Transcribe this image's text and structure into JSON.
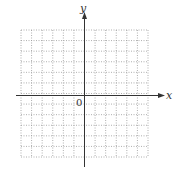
{
  "diagram": {
    "type": "coordinate-grid",
    "x_axis_label": "x",
    "y_axis_label": "y",
    "origin_label": "0",
    "grid": {
      "columns": 12,
      "rows": 12,
      "style": "dotted",
      "color": "#9a9a9a"
    },
    "axis_color": "#333333"
  },
  "chart_data": {
    "type": "scatter",
    "title": "",
    "xlabel": "x",
    "ylabel": "y",
    "x": [],
    "y": [],
    "grid": true,
    "annotations": [
      "0"
    ]
  }
}
